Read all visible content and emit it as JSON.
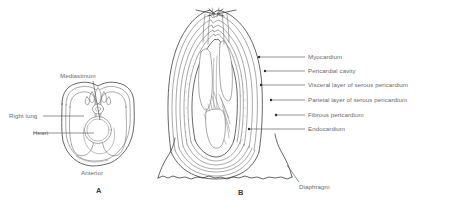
{
  "figure": {
    "background_color": "#ffffff",
    "line_color": "#414143",
    "text_color": "#6a6a6c"
  },
  "panel_a": {
    "letter": "A",
    "caption": "Anterior",
    "description": "Transverse cross-section of the thorax showing lungs, heart and mediastinum",
    "labels": [
      {
        "id": "mediastinum",
        "text": "Mediastinum"
      },
      {
        "id": "right-lung",
        "text": "Right lung"
      },
      {
        "id": "heart",
        "text": "Heart"
      }
    ]
  },
  "panel_b": {
    "letter": "B",
    "description": "Frontal section of the heart showing the layers of the pericardium and heart wall",
    "labels": [
      {
        "id": "myocardium",
        "text": "Myocardium"
      },
      {
        "id": "pericardial-cavity",
        "text": "Pericardial cavity"
      },
      {
        "id": "visceral-layer",
        "text": "Visceral layer of serous pericardium"
      },
      {
        "id": "parietal-layer",
        "text": "Parietal layer of serous pericardium"
      },
      {
        "id": "fibrous-pericardium",
        "text": "Fibrous pericardium"
      },
      {
        "id": "endocardium",
        "text": "Endocardium"
      }
    ],
    "bottom_label": {
      "id": "diaphragm",
      "text": "Diaphragm"
    }
  }
}
